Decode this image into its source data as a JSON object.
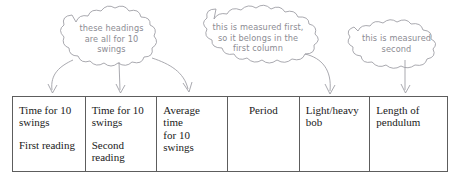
{
  "figure": {
    "type": "annotated-table-diagram",
    "background_color": "#ffffff",
    "annotation_color": "#8c8c93",
    "table_border_color": "#5d5d5d",
    "text_color": "#1a1a1a"
  },
  "annotations": [
    {
      "id": "callout-headings",
      "text": "these headings\nare all for 10\nswings",
      "points_to": [
        "col-1",
        "col-2",
        "col-3"
      ]
    },
    {
      "id": "callout-measured-first",
      "text": "this is measured first,\nso it belongs in the\nfirst column",
      "points_to": [
        "col-5"
      ]
    },
    {
      "id": "callout-measured-second",
      "text": "this is measured\nsecond",
      "points_to": [
        "col-6"
      ]
    }
  ],
  "table": {
    "columns": [
      {
        "id": "col-1",
        "heading": "Time for 10\nswings",
        "sub": "First reading"
      },
      {
        "id": "col-2",
        "heading": "Time for 10\nswings",
        "sub": "Second\nreading"
      },
      {
        "id": "col-3",
        "heading": "Average time\nfor 10 swings",
        "sub": ""
      },
      {
        "id": "col-4",
        "heading": "Period",
        "sub": ""
      },
      {
        "id": "col-5",
        "heading": "Light/heavy\nbob",
        "sub": ""
      },
      {
        "id": "col-6",
        "heading": "Length of\npendulum",
        "sub": ""
      }
    ]
  }
}
